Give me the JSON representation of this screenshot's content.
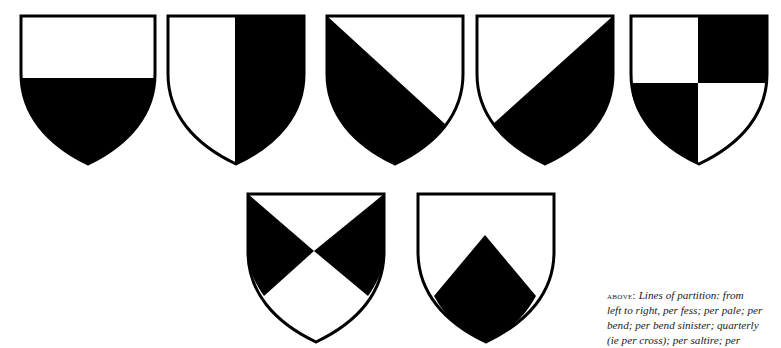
{
  "figure": {
    "title": "Lines of partition",
    "colors": {
      "field_light": "#ffffff",
      "field_dark": "#000000",
      "outline": "#000000"
    },
    "shields": [
      {
        "id": "per-fess",
        "label": "per fess"
      },
      {
        "id": "per-pale",
        "label": "per pale"
      },
      {
        "id": "per-bend",
        "label": "per bend"
      },
      {
        "id": "per-bend-sinister",
        "label": "per bend sinister"
      },
      {
        "id": "quarterly",
        "label": "quarterly (ie per cross)"
      },
      {
        "id": "per-saltire",
        "label": "per saltire"
      },
      {
        "id": "per-chevron",
        "label": "per chevron"
      }
    ]
  },
  "caption": {
    "lead": "above:",
    "line1": "Lines of partition: from",
    "line2": "left to right, per fess; per pale; per",
    "line3": "bend; per bend sinister; quarterly",
    "line4": "(ie per cross); per saltire; per"
  }
}
